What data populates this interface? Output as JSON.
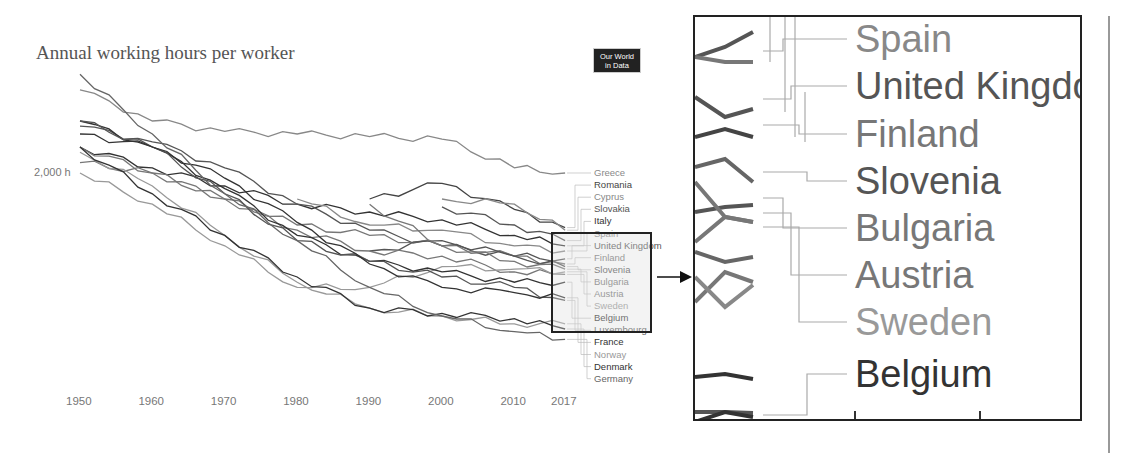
{
  "title": "Annual working hours per worker",
  "logo": {
    "line1": "Our World",
    "line2": "in Data"
  },
  "y_axis_label": "2,000 h",
  "x_axis_ticks": [
    "1950",
    "1960",
    "1970",
    "1980",
    "1990",
    "2000",
    "2010",
    "2017"
  ],
  "legend": [
    {
      "label": "Greece",
      "color": "#888888"
    },
    {
      "label": "Romania",
      "color": "#444444"
    },
    {
      "label": "Cyprus",
      "color": "#888888"
    },
    {
      "label": "Slovakia",
      "color": "#555555"
    },
    {
      "label": "Italy",
      "color": "#333333"
    },
    {
      "label": "Spain",
      "color": "#888888"
    },
    {
      "label": "United Kingdom",
      "color": "#555555"
    },
    {
      "label": "Finland",
      "color": "#777777"
    },
    {
      "label": "Slovenia",
      "color": "#555555"
    },
    {
      "label": "Bulgaria",
      "color": "#777777"
    },
    {
      "label": "Austria",
      "color": "#777777"
    },
    {
      "label": "Sweden",
      "color": "#999999"
    },
    {
      "label": "Belgium",
      "color": "#333333"
    },
    {
      "label": "Luxembourg",
      "color": "#555555"
    },
    {
      "label": "France",
      "color": "#333333"
    },
    {
      "label": "Norway",
      "color": "#999999"
    },
    {
      "label": "Denmark",
      "color": "#333333"
    },
    {
      "label": "Germany",
      "color": "#666666"
    }
  ],
  "zoom_panel": {
    "labels": [
      {
        "label": "Spain",
        "color": "#888888"
      },
      {
        "label": "United Kingdom",
        "color": "#555555"
      },
      {
        "label": "Finland",
        "color": "#777777"
      },
      {
        "label": "Slovenia",
        "color": "#555555"
      },
      {
        "label": "Bulgaria",
        "color": "#777777"
      },
      {
        "label": "Austria",
        "color": "#777777"
      },
      {
        "label": "Sweden",
        "color": "#999999"
      },
      {
        "label": "Belgium",
        "color": "#333333"
      }
    ]
  },
  "chart_data": {
    "type": "line",
    "title": "Annual working hours per worker",
    "xlabel": "",
    "ylabel": "",
    "x": [
      1950,
      1960,
      1970,
      1980,
      1990,
      2000,
      2010,
      2017
    ],
    "xlim": [
      1950,
      2017
    ],
    "ylim": [
      1300,
      2400
    ],
    "y_tick_labels": [
      "2,000 h"
    ],
    "grid": false,
    "legend_position": "right (inline labels)",
    "series": [
      {
        "name": "Greece",
        "values": [
          2320,
          2200,
          2160,
          2150,
          2140,
          2130,
          2020,
          2000
        ]
      },
      {
        "name": "Romania",
        "values": [
          null,
          null,
          null,
          null,
          1900,
          1960,
          1860,
          1790
        ]
      },
      {
        "name": "Cyprus",
        "values": [
          null,
          null,
          null,
          null,
          null,
          1900,
          1880,
          1780
        ]
      },
      {
        "name": "Slovakia",
        "values": [
          null,
          null,
          null,
          null,
          null,
          1870,
          1800,
          1740
        ]
      },
      {
        "name": "Italy",
        "values": [
          2100,
          2020,
          1950,
          1880,
          1850,
          1820,
          1760,
          1720
        ]
      },
      {
        "name": "Spain",
        "values": [
          null,
          null,
          null,
          1900,
          1800,
          1780,
          1720,
          1700
        ]
      },
      {
        "name": "United Kingdom",
        "values": [
          2180,
          2120,
          2020,
          1880,
          1780,
          1720,
          1680,
          1670
        ]
      },
      {
        "name": "Finland",
        "values": [
          2040,
          2000,
          1900,
          1800,
          1760,
          1720,
          1680,
          1650
        ]
      },
      {
        "name": "Slovenia",
        "values": [
          null,
          null,
          null,
          null,
          1700,
          1740,
          1680,
          1640
        ]
      },
      {
        "name": "Bulgaria",
        "values": [
          null,
          null,
          null,
          null,
          1880,
          1720,
          1660,
          1630
        ]
      },
      {
        "name": "Austria",
        "values": [
          2100,
          2000,
          1900,
          1780,
          1700,
          1680,
          1620,
          1610
        ]
      },
      {
        "name": "Sweden",
        "values": [
          2000,
          1880,
          1720,
          1560,
          1560,
          1640,
          1630,
          1620
        ]
      },
      {
        "name": "Belgium",
        "values": [
          2200,
          2100,
          1940,
          1760,
          1660,
          1620,
          1580,
          1580
        ]
      },
      {
        "name": "Luxembourg",
        "values": [
          2200,
          2100,
          1920,
          1740,
          1660,
          1600,
          1560,
          1510
        ]
      },
      {
        "name": "France",
        "values": [
          2150,
          2100,
          1980,
          1810,
          1650,
          1560,
          1540,
          1520
        ]
      },
      {
        "name": "Norway",
        "values": [
          2080,
          1950,
          1760,
          1580,
          1480,
          1450,
          1420,
          1420
        ]
      },
      {
        "name": "Denmark",
        "values": [
          2100,
          1920,
          1760,
          1600,
          1480,
          1460,
          1440,
          1400
        ]
      },
      {
        "name": "Germany",
        "values": [
          2380,
          2150,
          1920,
          1740,
          1560,
          1450,
          1390,
          1360
        ]
      }
    ]
  }
}
